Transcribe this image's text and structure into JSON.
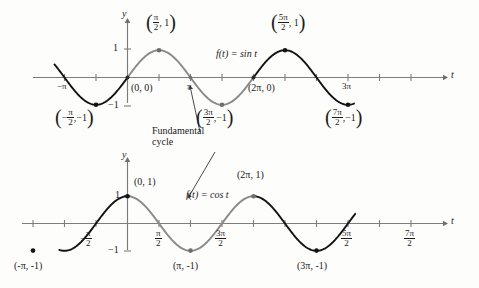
{
  "figure": {
    "background_color": "#fdfdfb",
    "curve_dark_color": "#131313",
    "curve_gray_color": "#8a8a8a",
    "axis_color": "#7d7d7d",
    "text_color": "#1b1b1b"
  },
  "annotations": {
    "fundamental_cycle_line1": "Fundamental",
    "fundamental_cycle_line2": "cycle"
  },
  "chart_data": [
    {
      "type": "line",
      "title": "f(t) = sin t",
      "function_label": "f(t) = sin t",
      "xlabel": "t",
      "ylabel": "y",
      "xlim": [
        -3.6,
        11.6
      ],
      "ylim": [
        -1.45,
        1.45
      ],
      "grid": false,
      "x_tick_labels": [
        {
          "value": "-π",
          "num": "",
          "den": "",
          "negative": true,
          "plain": "−π"
        },
        {
          "value": "π",
          "plain": "π"
        },
        {
          "value": "3π",
          "plain": "3π"
        }
      ],
      "y_tick_labels": [
        "1",
        "-1"
      ],
      "y_tick_1": "1",
      "y_tick_neg1": "−1",
      "labeled_points": [
        {
          "label": "(0, 0)",
          "x": 0,
          "y": 0,
          "marker": false
        },
        {
          "label": "(2π, 0)",
          "x": 6.2832,
          "y": 0,
          "marker": false
        },
        {
          "label": "(π/2, 1)",
          "x": 1.5708,
          "y": 1,
          "marker": true,
          "num": "π",
          "den": "2",
          "second": "1",
          "negfirst": false
        },
        {
          "label": "(-π/2, -1)",
          "x": -1.5708,
          "y": -1,
          "marker": true,
          "num": "π",
          "den": "2",
          "second": "−1",
          "negfirst": true
        },
        {
          "label": "(3π/2, -1)",
          "x": 4.7124,
          "y": -1,
          "marker": true,
          "num": "3π",
          "den": "2",
          "second": "−1",
          "negfirst": false
        },
        {
          "label": "(5π/2, 1)",
          "x": 7.854,
          "y": 1,
          "marker": true,
          "num": "5π",
          "den": "2",
          "second": "1",
          "negfirst": false
        },
        {
          "label": "(7π/2, -1)",
          "x": 10.9956,
          "y": -1,
          "marker": true,
          "num": "7π",
          "den": "2",
          "second": "−1",
          "negfirst": false
        }
      ],
      "fundamental_cycle_range": [
        0,
        6.2832
      ],
      "series": [
        {
          "name": "sin t",
          "formula": "y = sin(t)",
          "amplitude": 1,
          "period": 6.2832,
          "phase": 0
        }
      ]
    },
    {
      "type": "line",
      "title": "f(t) = cos t",
      "function_label": "f(t) = cos t",
      "xlabel": "t",
      "ylabel": "y",
      "xlim": [
        -3.9,
        11.8
      ],
      "ylim": [
        -1.45,
        1.45
      ],
      "grid": false,
      "x_tick_labels": [
        {
          "value": "-π/2",
          "num": "π",
          "den": "2",
          "negative": true
        },
        {
          "value": "π/2",
          "num": "π",
          "den": "2",
          "negative": false
        },
        {
          "value": "3π/2",
          "num": "3π",
          "den": "2",
          "negative": false
        },
        {
          "value": "5π/2",
          "num": "5π",
          "den": "2",
          "negative": false
        },
        {
          "value": "7π/2",
          "num": "7π",
          "den": "2",
          "negative": false
        }
      ],
      "y_tick_labels": [
        "1",
        "-1"
      ],
      "y_tick_1": "1",
      "y_tick_neg1": "−1",
      "labeled_points": [
        {
          "label": "(0, 1)",
          "x": 0,
          "y": 1,
          "marker": true
        },
        {
          "label": "(-π, -1)",
          "x": -3.1416,
          "y": -1,
          "marker": true
        },
        {
          "label": "(π, -1)",
          "x": 3.1416,
          "y": -1,
          "marker": true
        },
        {
          "label": "(2π, 1)",
          "x": 6.2832,
          "y": 1,
          "marker": true
        },
        {
          "label": "(3π, -1)",
          "x": 9.4248,
          "y": -1,
          "marker": true
        }
      ],
      "fundamental_cycle_range": [
        0,
        6.2832
      ],
      "series": [
        {
          "name": "cos t",
          "formula": "y = cos(t)",
          "amplitude": 1,
          "period": 6.2832,
          "phase": 0
        }
      ]
    }
  ]
}
